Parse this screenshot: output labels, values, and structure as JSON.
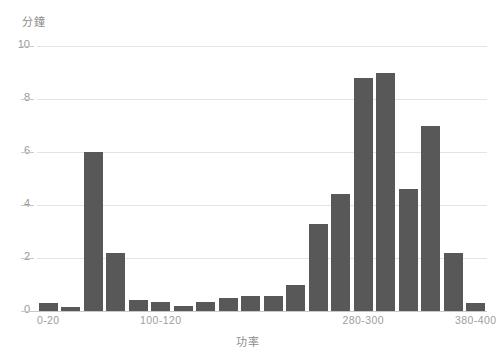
{
  "chart_data": {
    "type": "bar",
    "title": "",
    "subtitle": "",
    "xlabel": "功率",
    "ylabel": "分鐘",
    "grid": true,
    "legend": false,
    "legend_position": "none",
    "bar_color": "#585858",
    "gridline_color": "#e4e4e4",
    "axis_color": "#c9c9c9",
    "tick_label_color": "#9a9a9a",
    "ylim": [
      0,
      10
    ],
    "y_ticks": [
      "0",
      "2",
      "4",
      "6",
      "8",
      "10"
    ],
    "y_tick_values": [
      0,
      2,
      4,
      6,
      8,
      10
    ],
    "x_tick_labels": [
      "0-20",
      "100-120",
      "280-300",
      "380-400"
    ],
    "x_tick_indices": [
      0,
      5,
      14,
      19
    ],
    "categories": [
      "0-20",
      "20-40",
      "40-60",
      "60-80",
      "80-100",
      "100-120",
      "120-140",
      "140-160",
      "160-180",
      "180-200",
      "200-220",
      "220-240",
      "240-260",
      "260-280",
      "280-300",
      "300-320",
      "320-340",
      "340-360",
      "360-380",
      "380-400"
    ],
    "values": [
      0.3,
      0.15,
      6.0,
      2.2,
      0.4,
      0.35,
      0.2,
      0.35,
      0.5,
      0.55,
      0.55,
      1.0,
      3.3,
      4.4,
      8.8,
      9.0,
      4.6,
      7.0,
      2.2,
      0.3
    ]
  }
}
